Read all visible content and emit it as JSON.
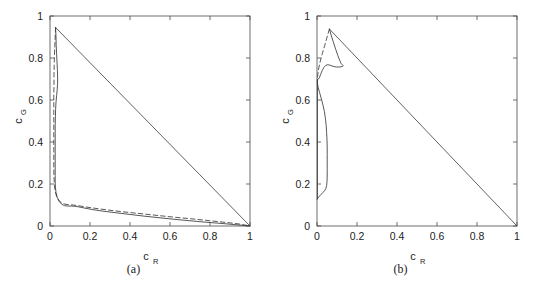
{
  "figure": {
    "panels": [
      {
        "caption": "(a)",
        "axes": {
          "xlabel_base": "c",
          "xlabel_sub": "R",
          "ylabel_base": "c",
          "ylabel_sub": "G",
          "xticks": [
            "0",
            "0.2",
            "0.4",
            "0.6",
            "0.8",
            "1"
          ],
          "yticks": [
            "0",
            "0.2",
            "0.4",
            "0.6",
            "0.8",
            "1"
          ],
          "xlim": [
            0,
            1
          ],
          "ylim": [
            0,
            1
          ]
        }
      },
      {
        "caption": "(b)",
        "axes": {
          "xlabel_base": "c",
          "xlabel_sub": "R",
          "ylabel_base": "c",
          "ylabel_sub": "G",
          "xticks": [
            "0",
            "0.2",
            "0.4",
            "0.6",
            "0.8",
            "1"
          ],
          "yticks": [
            "0",
            "0.2",
            "0.4",
            "0.6",
            "0.8",
            "1"
          ],
          "xlim": [
            0,
            1
          ],
          "ylim": [
            0,
            1
          ]
        }
      }
    ]
  },
  "colors": {
    "background": "#ffffff",
    "axis": "#4a4a4a",
    "curve": "#3a3a3a",
    "text": "#222222"
  },
  "chart_data": [
    {
      "type": "line",
      "title": "(a)",
      "xlabel": "c_R",
      "ylabel": "c_G",
      "xlim": [
        0,
        1
      ],
      "ylim": [
        0,
        1
      ],
      "xticks": [
        0,
        0.2,
        0.4,
        0.6,
        0.8,
        1
      ],
      "yticks": [
        0,
        0.2,
        0.4,
        0.6,
        0.8,
        1
      ],
      "grid": false,
      "legend": "none",
      "series": [
        {
          "name": "simplex-hypotenuse",
          "style": "solid",
          "points": [
            [
              0.028,
              0.945
            ],
            [
              1.0,
              0.0
            ]
          ]
        },
        {
          "name": "solid-boundary",
          "style": "solid",
          "points": [
            [
              0.028,
              0.945
            ],
            [
              0.03,
              0.9
            ],
            [
              0.031,
              0.86
            ],
            [
              0.033,
              0.82
            ],
            [
              0.035,
              0.78
            ],
            [
              0.037,
              0.745
            ],
            [
              0.038,
              0.71
            ],
            [
              0.038,
              0.68
            ],
            [
              0.036,
              0.65
            ],
            [
              0.033,
              0.62
            ],
            [
              0.03,
              0.59
            ],
            [
              0.028,
              0.555
            ],
            [
              0.027,
              0.52
            ],
            [
              0.026,
              0.48
            ],
            [
              0.026,
              0.44
            ],
            [
              0.026,
              0.4
            ],
            [
              0.026,
              0.36
            ],
            [
              0.026,
              0.32
            ],
            [
              0.026,
              0.28
            ],
            [
              0.026,
              0.24
            ],
            [
              0.026,
              0.21
            ],
            [
              0.027,
              0.185
            ],
            [
              0.03,
              0.16
            ],
            [
              0.036,
              0.137
            ],
            [
              0.045,
              0.118
            ],
            [
              0.058,
              0.104
            ],
            [
              0.072,
              0.097
            ],
            [
              0.088,
              0.095
            ],
            [
              0.105,
              0.095
            ],
            [
              0.125,
              0.094
            ],
            [
              0.15,
              0.09
            ],
            [
              0.18,
              0.084
            ],
            [
              0.22,
              0.077
            ],
            [
              0.27,
              0.07
            ],
            [
              0.33,
              0.063
            ],
            [
              0.4,
              0.055
            ],
            [
              0.47,
              0.047
            ],
            [
              0.54,
              0.04
            ],
            [
              0.62,
              0.032
            ],
            [
              0.7,
              0.025
            ],
            [
              0.78,
              0.018
            ],
            [
              0.86,
              0.012
            ],
            [
              0.93,
              0.006
            ],
            [
              1.0,
              0.0
            ]
          ]
        },
        {
          "name": "dashed-boundary",
          "style": "dashed",
          "points": [
            [
              0.028,
              0.945
            ],
            [
              0.026,
              0.9
            ],
            [
              0.024,
              0.855
            ],
            [
              0.022,
              0.81
            ],
            [
              0.021,
              0.765
            ],
            [
              0.02,
              0.72
            ],
            [
              0.02,
              0.675
            ],
            [
              0.019,
              0.63
            ],
            [
              0.019,
              0.585
            ],
            [
              0.019,
              0.54
            ],
            [
              0.019,
              0.495
            ],
            [
              0.019,
              0.45
            ],
            [
              0.019,
              0.405
            ],
            [
              0.019,
              0.36
            ],
            [
              0.019,
              0.315
            ],
            [
              0.019,
              0.27
            ],
            [
              0.02,
              0.23
            ],
            [
              0.022,
              0.195
            ],
            [
              0.026,
              0.165
            ],
            [
              0.033,
              0.14
            ],
            [
              0.044,
              0.122
            ],
            [
              0.058,
              0.11
            ],
            [
              0.075,
              0.104
            ],
            [
              0.095,
              0.101
            ],
            [
              0.115,
              0.1
            ],
            [
              0.14,
              0.097
            ],
            [
              0.17,
              0.092
            ],
            [
              0.205,
              0.087
            ],
            [
              0.25,
              0.081
            ],
            [
              0.3,
              0.075
            ],
            [
              0.36,
              0.068
            ],
            [
              0.42,
              0.062
            ],
            [
              0.49,
              0.055
            ],
            [
              0.56,
              0.048
            ],
            [
              0.63,
              0.041
            ],
            [
              0.7,
              0.035
            ],
            [
              0.77,
              0.028
            ],
            [
              0.84,
              0.021
            ],
            [
              0.9,
              0.015
            ],
            [
              0.95,
              0.009
            ],
            [
              1.0,
              0.0
            ]
          ]
        }
      ]
    },
    {
      "type": "line",
      "title": "(b)",
      "xlabel": "c_R",
      "ylabel": "c_G",
      "xlim": [
        0,
        1
      ],
      "ylim": [
        0,
        1
      ],
      "xticks": [
        0,
        0.2,
        0.4,
        0.6,
        0.8,
        1
      ],
      "yticks": [
        0,
        0.2,
        0.4,
        0.6,
        0.8,
        1
      ],
      "grid": false,
      "legend": "none",
      "series": [
        {
          "name": "simplex-hypotenuse",
          "style": "solid",
          "points": [
            [
              0.062,
              0.938
            ],
            [
              1.0,
              0.0
            ]
          ]
        },
        {
          "name": "solid-boundary",
          "style": "solid",
          "points": [
            [
              0.062,
              0.938
            ],
            [
              0.072,
              0.905
            ],
            [
              0.083,
              0.872
            ],
            [
              0.094,
              0.84
            ],
            [
              0.104,
              0.812
            ],
            [
              0.113,
              0.79
            ],
            [
              0.12,
              0.775
            ],
            [
              0.126,
              0.768
            ],
            [
              0.13,
              0.764
            ],
            [
              0.131,
              0.762
            ],
            [
              0.128,
              0.76
            ],
            [
              0.12,
              0.758
            ],
            [
              0.11,
              0.757
            ],
            [
              0.098,
              0.757
            ],
            [
              0.086,
              0.759
            ],
            [
              0.075,
              0.762
            ],
            [
              0.064,
              0.766
            ],
            [
              0.054,
              0.768
            ],
            [
              0.044,
              0.765
            ],
            [
              0.034,
              0.755
            ],
            [
              0.026,
              0.74
            ],
            [
              0.018,
              0.722
            ],
            [
              0.012,
              0.706
            ],
            [
              0.007,
              0.7
            ],
            [
              0.004,
              0.698
            ],
            [
              0.002,
              0.694
            ],
            [
              0.002,
              0.68
            ],
            [
              0.006,
              0.66
            ],
            [
              0.013,
              0.635
            ],
            [
              0.022,
              0.605
            ],
            [
              0.03,
              0.575
            ],
            [
              0.037,
              0.545
            ],
            [
              0.042,
              0.512
            ],
            [
              0.046,
              0.478
            ],
            [
              0.048,
              0.445
            ],
            [
              0.05,
              0.41
            ],
            [
              0.051,
              0.375
            ],
            [
              0.051,
              0.34
            ],
            [
              0.051,
              0.305
            ],
            [
              0.051,
              0.27
            ],
            [
              0.051,
              0.238
            ],
            [
              0.05,
              0.212
            ],
            [
              0.048,
              0.192
            ],
            [
              0.044,
              0.178
            ],
            [
              0.038,
              0.168
            ],
            [
              0.03,
              0.16
            ],
            [
              0.022,
              0.152
            ],
            [
              0.014,
              0.144
            ],
            [
              0.008,
              0.137
            ],
            [
              0.004,
              0.132
            ],
            [
              0.002,
              0.129
            ],
            [
              0.001,
              0.128
            ]
          ]
        },
        {
          "name": "dashed-boundary",
          "style": "dashed",
          "points": [
            [
              0.062,
              0.938
            ],
            [
              0.056,
              0.918
            ],
            [
              0.05,
              0.898
            ],
            [
              0.044,
              0.878
            ],
            [
              0.038,
              0.858
            ],
            [
              0.032,
              0.84
            ],
            [
              0.027,
              0.822
            ],
            [
              0.022,
              0.806
            ],
            [
              0.018,
              0.79
            ],
            [
              0.014,
              0.776
            ],
            [
              0.011,
              0.762
            ],
            [
              0.008,
              0.748
            ],
            [
              0.006,
              0.734
            ],
            [
              0.004,
              0.722
            ],
            [
              0.003,
              0.712
            ],
            [
              0.002,
              0.704
            ],
            [
              0.002,
              0.698
            ]
          ]
        },
        {
          "name": "left-edge-lower",
          "style": "solid",
          "points": [
            [
              0.002,
              0.698
            ],
            [
              0.002,
              0.128
            ]
          ]
        }
      ]
    }
  ]
}
